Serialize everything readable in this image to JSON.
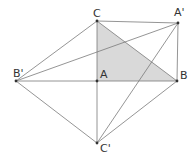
{
  "diagram": {
    "colors": {
      "line": "#6b6b6b",
      "fill": "#d9d9d9",
      "point": "#333333",
      "label": "#333333"
    },
    "points": {
      "C": {
        "label": "C",
        "x": 97,
        "y": 21
      },
      "A2": {
        "label": "A'",
        "x": 178,
        "y": 23
      },
      "B2": {
        "label": "B'",
        "x": 16,
        "y": 81
      },
      "A": {
        "label": "A",
        "x": 97,
        "y": 81
      },
      "B": {
        "label": "B",
        "x": 177,
        "y": 81
      },
      "C2": {
        "label": "C'",
        "x": 97,
        "y": 143
      }
    },
    "shaded_triangle": [
      "C",
      "A",
      "B"
    ],
    "segments": [
      [
        "C",
        "A'"
      ],
      [
        "A'",
        "B"
      ],
      [
        "B'",
        "C"
      ],
      [
        "B'",
        "A'"
      ],
      [
        "B'",
        "B"
      ],
      [
        "B'",
        "C'"
      ],
      [
        "C'",
        "B"
      ],
      [
        "C'",
        "A'"
      ],
      [
        "C",
        "C'"
      ],
      [
        "C",
        "B"
      ]
    ]
  }
}
